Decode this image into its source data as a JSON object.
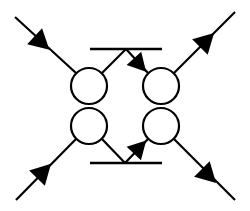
{
  "diagram": {
    "colors": {
      "background": "#ffffff",
      "stroke": "#000000"
    },
    "vertices": [
      {
        "id": "top-left",
        "cx": 89,
        "cy": 86,
        "r": 18
      },
      {
        "id": "top-right",
        "cx": 161,
        "cy": 86,
        "r": 18
      },
      {
        "id": "bottom-left",
        "cx": 89,
        "cy": 126,
        "r": 18
      },
      {
        "id": "bottom-right",
        "cx": 161,
        "cy": 126,
        "r": 18
      }
    ],
    "external_legs": [
      {
        "id": "incoming-top-left",
        "from": [
          15,
          17
        ],
        "to": [
          76,
          73
        ],
        "arrow_at": [
          42,
          43
        ],
        "direction": "in"
      },
      {
        "id": "outgoing-top-right",
        "from": [
          174,
          73
        ],
        "to": [
          235,
          12
        ],
        "arrow_at": [
          207,
          40
        ],
        "direction": "out"
      },
      {
        "id": "incoming-bottom-left",
        "from": [
          16,
          200
        ],
        "to": [
          76,
          139
        ],
        "arrow_at": [
          44,
          171
        ],
        "direction": "in"
      },
      {
        "id": "outgoing-bottom-right",
        "from": [
          174,
          139
        ],
        "to": [
          235,
          200
        ],
        "arrow_at": [
          209,
          176
        ],
        "direction": "out"
      }
    ],
    "bars": [
      {
        "id": "top-bar",
        "x1": 90,
        "x2": 162,
        "y": 49
      },
      {
        "id": "bottom-bar",
        "x1": 90,
        "x2": 162,
        "y": 163
      }
    ],
    "internal_lines": [
      {
        "id": "top-left-to-apex",
        "from": [
          102,
          73
        ],
        "to": [
          126,
          49
        ],
        "arrow": false
      },
      {
        "id": "apex-to-top-right",
        "from": [
          126,
          49
        ],
        "to": [
          148,
          73
        ],
        "arrow": true,
        "arrow_at": [
          140,
          65
        ]
      },
      {
        "id": "bottom-left-to-apex",
        "from": [
          102,
          139
        ],
        "to": [
          125,
          163
        ],
        "arrow": false
      },
      {
        "id": "apex-to-bottom-right",
        "from": [
          125,
          163
        ],
        "to": [
          148,
          139
        ],
        "arrow": true,
        "arrow_at": [
          140,
          147
        ]
      }
    ]
  }
}
